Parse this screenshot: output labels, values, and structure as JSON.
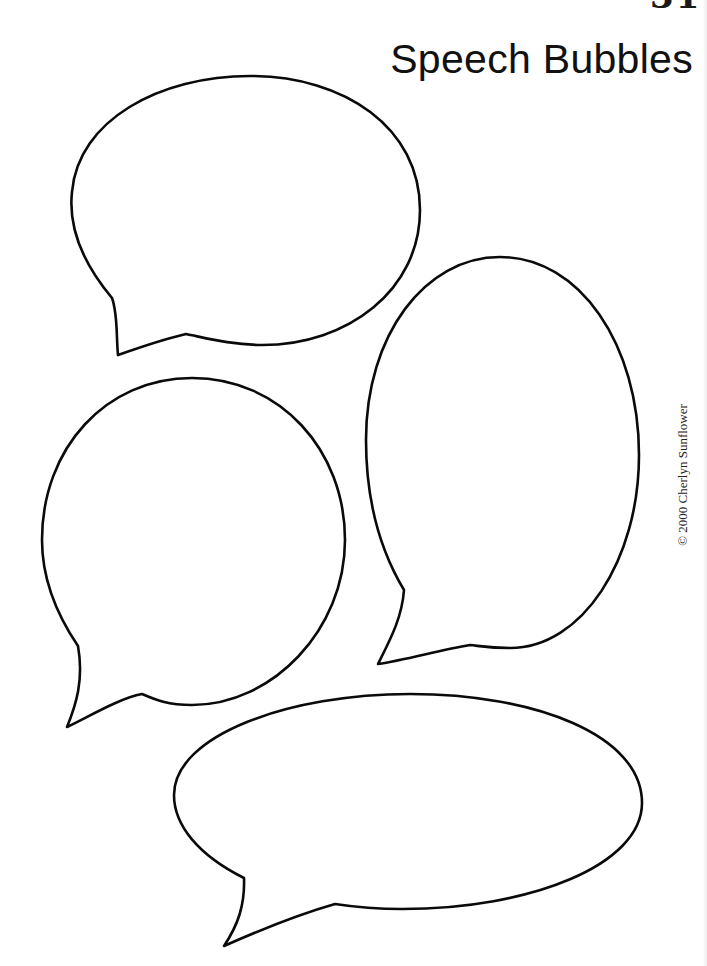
{
  "page": {
    "number_partial": "31",
    "title": "Speech Bubbles",
    "copyright": "© 2000 Cherlyn Sunflower"
  },
  "bubbles": [
    {
      "id": "top-left",
      "shape": "horizontal-oval",
      "tail": "bottom-left"
    },
    {
      "id": "right",
      "shape": "vertical-oval",
      "tail": "bottom-left"
    },
    {
      "id": "middle-left",
      "shape": "round",
      "tail": "bottom-left"
    },
    {
      "id": "bottom",
      "shape": "wide-oval",
      "tail": "bottom-left"
    }
  ],
  "colors": {
    "background": "#ffffff",
    "outline": "#0a0a0a",
    "text": "#111111"
  }
}
